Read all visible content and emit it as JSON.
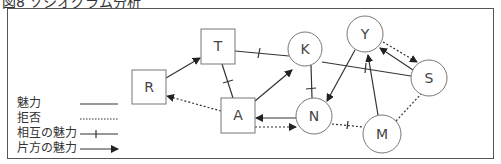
{
  "title": "図8 ソシオグラム分析",
  "legend": {
    "items": [
      {
        "label": "魅力",
        "style": "solid"
      },
      {
        "label": "拒否",
        "style": "dotted"
      },
      {
        "label": "相互の魅力",
        "style": "solid-tick"
      },
      {
        "label": "片方の魅力",
        "style": "arrow"
      }
    ]
  },
  "nodes": [
    {
      "id": "R",
      "label": "R",
      "shape": "square"
    },
    {
      "id": "T",
      "label": "T",
      "shape": "square"
    },
    {
      "id": "A",
      "label": "A",
      "shape": "square"
    },
    {
      "id": "K",
      "label": "K",
      "shape": "circle"
    },
    {
      "id": "N",
      "label": "N",
      "shape": "circle"
    },
    {
      "id": "Y",
      "label": "Y",
      "shape": "circle"
    },
    {
      "id": "S",
      "label": "S",
      "shape": "circle"
    },
    {
      "id": "M",
      "label": "M",
      "shape": "circle"
    }
  ],
  "edges": [
    {
      "from": "R",
      "to": "T",
      "type": "one-way attraction"
    },
    {
      "from": "T",
      "to": "K",
      "type": "mutual attraction"
    },
    {
      "from": "T",
      "to": "A",
      "type": "mutual attraction"
    },
    {
      "from": "A",
      "to": "R",
      "type": "rejection"
    },
    {
      "from": "A",
      "to": "K",
      "type": "one-way attraction"
    },
    {
      "from": "N",
      "to": "A",
      "type": "one-way attraction"
    },
    {
      "from": "A",
      "to": "N",
      "type": "rejection (one-way)"
    },
    {
      "from": "K",
      "to": "N",
      "type": "mutual attraction"
    },
    {
      "from": "K",
      "to": "S",
      "type": "mutual attraction"
    },
    {
      "from": "Y",
      "to": "N",
      "type": "one-way attraction"
    },
    {
      "from": "S",
      "to": "Y",
      "type": "one-way attraction"
    },
    {
      "from": "Y",
      "to": "S",
      "type": "rejection (one-way)"
    },
    {
      "from": "M",
      "to": "Y",
      "type": "one-way attraction"
    },
    {
      "from": "N",
      "to": "M",
      "type": "mutual rejection"
    },
    {
      "from": "M",
      "to": "S",
      "type": "rejection"
    }
  ]
}
